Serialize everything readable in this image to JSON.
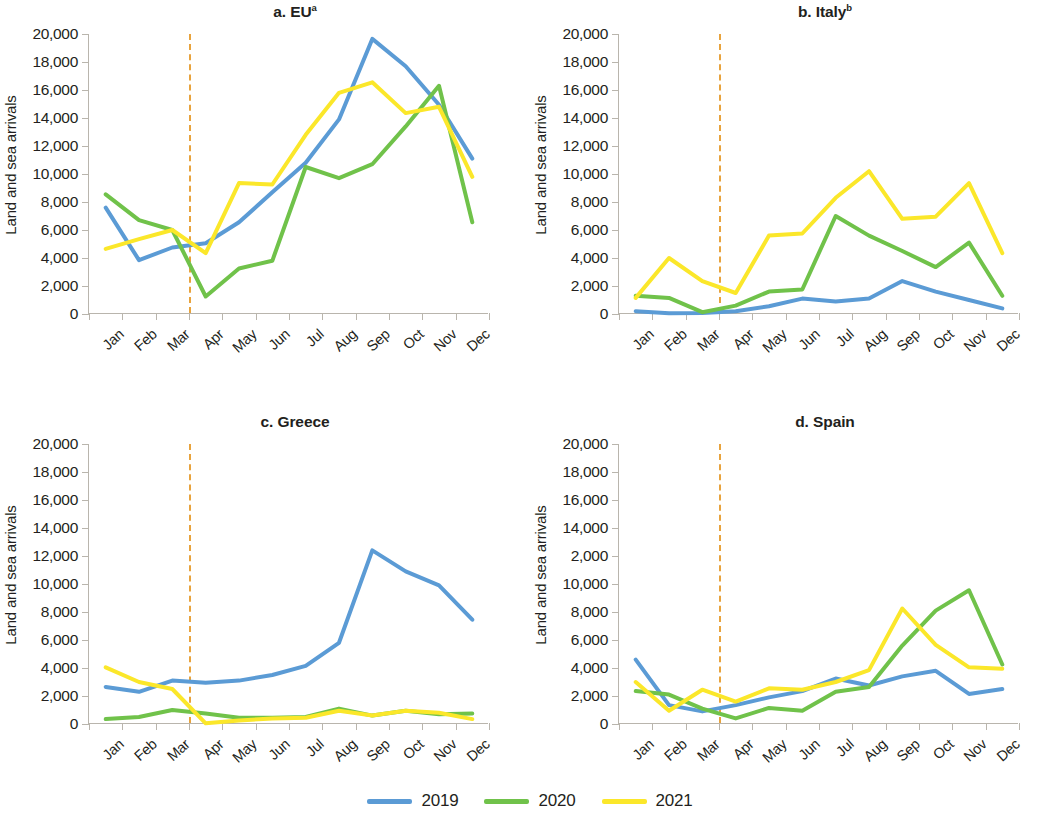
{
  "figure": {
    "ylabel": "Land and sea arrivals",
    "yticks": [
      "20,000",
      "18,000",
      "16,000",
      "14,000",
      "12,000",
      "10,000",
      "8,000",
      "6,000",
      "4,000",
      "2,000",
      "0"
    ],
    "yticks_spain": [
      "20,000",
      "18,000",
      "16,000",
      "14,000",
      "2,000",
      "10,000",
      "8,000",
      "6,000",
      "4,000",
      "2,000",
      "0"
    ],
    "months": [
      "Jan",
      "Feb",
      "Mar",
      "Apr",
      "May",
      "Jun",
      "Jul",
      "Aug",
      "Sep",
      "Oct",
      "Nov",
      "Dec"
    ],
    "colors": {
      "series_2019": "#5b9bd5",
      "series_2020": "#70c24a",
      "series_2021": "#fbe72a",
      "marker_line": "#e8a33d",
      "axis": "#b9b5ad",
      "text": "#231f20"
    },
    "legend": [
      {
        "label": "2019",
        "color": "#5b9bd5"
      },
      {
        "label": "2020",
        "color": "#70c24a"
      },
      {
        "label": "2021",
        "color": "#fbe72a"
      }
    ],
    "marker_line_note": "dashed vertical line between Mar and Apr (COVID-19 onset, March 2020)"
  },
  "chart_data": [
    {
      "type": "line",
      "panel": "a",
      "title": "a. EU",
      "title_superscript": "a",
      "xlabel": "",
      "ylabel": "Land and sea arrivals",
      "ylim": [
        0,
        20000
      ],
      "ytick_step": 2000,
      "grid": false,
      "legend_position": "bottom-center-shared",
      "categories": [
        "Jan",
        "Feb",
        "Mar",
        "Apr",
        "May",
        "Jun",
        "Jul",
        "Aug",
        "Sep",
        "Oct",
        "Nov",
        "Dec"
      ],
      "series": [
        {
          "name": "2019",
          "color": "#5b9bd5",
          "values": [
            7600,
            3850,
            4750,
            5050,
            6550,
            8700,
            10800,
            13900,
            19650,
            17700,
            14950,
            11100
          ]
        },
        {
          "name": "2020",
          "color": "#70c24a",
          "values": [
            8550,
            6700,
            6000,
            1250,
            3250,
            3800,
            10500,
            9700,
            10700,
            13400,
            16300,
            6550
          ]
        },
        {
          "name": "2021",
          "color": "#fbe72a",
          "values": [
            4650,
            5350,
            6000,
            4350,
            9350,
            9250,
            12800,
            15800,
            16550,
            14350,
            14800,
            9800
          ]
        }
      ]
    },
    {
      "type": "line",
      "panel": "b",
      "title": "b. Italy",
      "title_superscript": "b",
      "xlabel": "",
      "ylabel": "Land and sea arrivals",
      "ylim": [
        0,
        20000
      ],
      "ytick_step": 2000,
      "grid": false,
      "categories": [
        "Jan",
        "Feb",
        "Mar",
        "Apr",
        "May",
        "Jun",
        "Jul",
        "Aug",
        "Sep",
        "Oct",
        "Nov",
        "Dec"
      ],
      "series": [
        {
          "name": "2019",
          "color": "#5b9bd5",
          "values": [
            200,
            60,
            80,
            200,
            550,
            1100,
            900,
            1100,
            2350,
            1600,
            1000,
            400
          ]
        },
        {
          "name": "2020",
          "color": "#70c24a",
          "values": [
            1300,
            1150,
            130,
            600,
            1600,
            1750,
            7000,
            5600,
            4500,
            3350,
            5100,
            1300
          ]
        },
        {
          "name": "2021",
          "color": "#fbe72a",
          "values": [
            1150,
            4000,
            2350,
            1500,
            5600,
            5750,
            8300,
            10200,
            6800,
            6950,
            9350,
            4350
          ]
        }
      ]
    },
    {
      "type": "line",
      "panel": "c",
      "title": "c. Greece",
      "title_superscript": "",
      "xlabel": "",
      "ylabel": "Land and sea arrivals",
      "ylim": [
        0,
        20000
      ],
      "ytick_step": 2000,
      "grid": false,
      "categories": [
        "Jan",
        "Feb",
        "Mar",
        "Apr",
        "May",
        "Jun",
        "Jul",
        "Aug",
        "Sep",
        "Oct",
        "Nov",
        "Dec"
      ],
      "series": [
        {
          "name": "2019",
          "color": "#5b9bd5",
          "values": [
            2650,
            2300,
            3100,
            2950,
            3100,
            3500,
            4150,
            5800,
            12400,
            10900,
            9900,
            7450
          ]
        },
        {
          "name": "2020",
          "color": "#70c24a",
          "values": [
            350,
            500,
            1000,
            750,
            450,
            450,
            500,
            1100,
            600,
            950,
            700,
            750
          ]
        },
        {
          "name": "2021",
          "color": "#fbe72a",
          "values": [
            4050,
            3000,
            2500,
            50,
            250,
            400,
            450,
            950,
            600,
            950,
            800,
            350
          ]
        }
      ]
    },
    {
      "type": "line",
      "panel": "d",
      "title": "d. Spain",
      "title_superscript": "",
      "xlabel": "",
      "ylabel": "Land and sea arrivals",
      "ylim": [
        0,
        20000
      ],
      "ytick_step": 2000,
      "grid": false,
      "ytick_label_anomaly": "the 12,000 tick is printed as 2,000 in the source figure",
      "categories": [
        "Jan",
        "Feb",
        "Mar",
        "Apr",
        "May",
        "Jun",
        "Jul",
        "Aug",
        "Sep",
        "Oct",
        "Nov",
        "Dec"
      ],
      "series": [
        {
          "name": "2019",
          "color": "#5b9bd5",
          "values": [
            4600,
            1350,
            900,
            1350,
            1900,
            2350,
            3250,
            2750,
            3400,
            3800,
            2150,
            2500
          ]
        },
        {
          "name": "2020",
          "color": "#70c24a",
          "values": [
            2350,
            2100,
            1100,
            400,
            1150,
            950,
            2300,
            2650,
            5600,
            8100,
            9550,
            4250
          ]
        },
        {
          "name": "2021",
          "color": "#fbe72a",
          "values": [
            3000,
            950,
            2450,
            1600,
            2550,
            2450,
            3000,
            3850,
            8250,
            5650,
            4050,
            3950
          ]
        }
      ]
    }
  ]
}
